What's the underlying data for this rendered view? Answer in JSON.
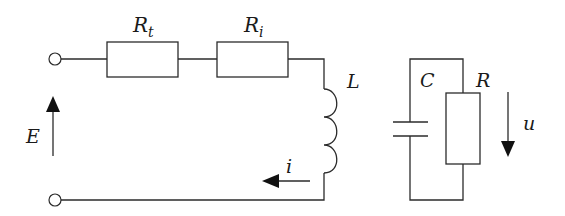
{
  "diagram": {
    "type": "electrical-circuit",
    "labels": {
      "source_emf": "E",
      "resistor_t": "R",
      "resistor_t_sub": "t",
      "resistor_i": "R",
      "resistor_i_sub": "i",
      "inductor": "L",
      "current": "i",
      "capacitor": "C",
      "load_resistor": "R",
      "voltage": "u"
    },
    "components": [
      {
        "id": "terminal-top",
        "kind": "terminal"
      },
      {
        "id": "terminal-bottom",
        "kind": "terminal"
      },
      {
        "id": "Rt",
        "kind": "resistor",
        "label": "Rt"
      },
      {
        "id": "Ri",
        "kind": "resistor",
        "label": "Ri"
      },
      {
        "id": "L",
        "kind": "inductor",
        "label": "L"
      },
      {
        "id": "C",
        "kind": "capacitor",
        "label": "C"
      },
      {
        "id": "R",
        "kind": "resistor",
        "label": "R"
      }
    ],
    "arrows": [
      {
        "id": "E",
        "direction": "up",
        "meaning": "source EMF"
      },
      {
        "id": "i",
        "direction": "left",
        "meaning": "current"
      },
      {
        "id": "u",
        "direction": "down",
        "meaning": "voltage across RC"
      }
    ],
    "colors": {
      "line": "#2b2b2b",
      "background": "#ffffff"
    }
  }
}
